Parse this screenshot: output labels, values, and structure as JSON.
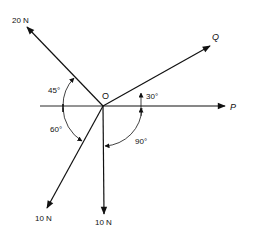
{
  "diagram": {
    "origin": {
      "label": "O",
      "x": 103,
      "y": 106
    },
    "reference_line": {
      "x1": 40,
      "y1": 106,
      "x2": 103,
      "y2": 106
    },
    "forces": [
      {
        "id": "f20",
        "label": "20 N",
        "tip": [
          27,
          27
        ],
        "label_pos": [
          12,
          23
        ],
        "style": "normal"
      },
      {
        "id": "q",
        "label": "Q",
        "tip": [
          210,
          46
        ],
        "label_pos": [
          212,
          37
        ],
        "style": "italic"
      },
      {
        "id": "p",
        "label": "P",
        "tip": [
          225,
          106
        ],
        "label_pos": [
          230,
          110
        ],
        "style": "italic"
      },
      {
        "id": "f10a",
        "label": "10 N",
        "tip": [
          47,
          208
        ],
        "label_pos": [
          35,
          220
        ],
        "style": "normal"
      },
      {
        "id": "f10b",
        "label": "10 N",
        "tip": [
          104,
          214
        ],
        "label_pos": [
          95,
          224
        ],
        "style": "normal"
      }
    ],
    "angles": [
      {
        "id": "a45",
        "label": "45°",
        "label_pos": [
          49,
          90
        ]
      },
      {
        "id": "a60",
        "label": "60°",
        "label_pos": [
          50,
          129
        ]
      },
      {
        "id": "a30",
        "label": "30°",
        "label_pos": [
          146,
          97
        ]
      },
      {
        "id": "a90",
        "label": "90°",
        "label_pos": [
          135,
          146
        ]
      }
    ],
    "colors": {
      "stroke": "#111111",
      "background": "#ffffff"
    }
  }
}
